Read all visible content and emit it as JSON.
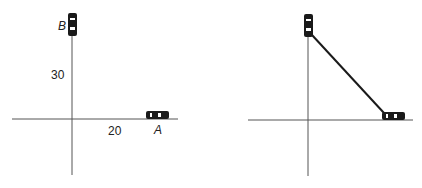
{
  "left_panel": {
    "car_b_label": "B",
    "car_a_label": "A",
    "distance_b_label": "30",
    "distance_a_label": "20"
  },
  "right_panel": {
    "description": "Cars A and B joined by a straight line segment"
  },
  "colors": {
    "axis": "#555555",
    "car": "#1a1a1a",
    "connector": "#1a1a1a"
  }
}
